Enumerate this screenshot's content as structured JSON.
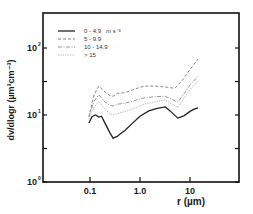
{
  "chart_data": {
    "type": "line",
    "title": "",
    "xlabel": "r (µm)",
    "ylabel": "dv/dlogr (µm³cm⁻³)",
    "xscale": "log",
    "yscale": "log",
    "xlim": [
      0.013,
      100
    ],
    "ylim": [
      1,
      300
    ],
    "x_ticks": [
      {
        "value": 0.1,
        "label": "0.1"
      },
      {
        "value": 1.0,
        "label": "1.0"
      },
      {
        "value": 10,
        "label": "10"
      }
    ],
    "y_ticks": [
      {
        "value": 1,
        "label": "10",
        "exp": "0"
      },
      {
        "value": 10,
        "label": "10",
        "exp": "1"
      },
      {
        "value": 100,
        "label": "10",
        "exp": "2"
      }
    ],
    "grid": false,
    "legend_position": "upper-left",
    "legend_unit": "m s⁻¹",
    "series": [
      {
        "name": "0 - 4.9",
        "style": "solid",
        "x": [
          0.095,
          0.11,
          0.13,
          0.15,
          0.17,
          0.2,
          0.25,
          0.29,
          0.35,
          0.4,
          0.5,
          0.7,
          1.0,
          1.5,
          2.2,
          3.2,
          4.0,
          5.7,
          7.5,
          10,
          12,
          14.5
        ],
        "y": [
          7.6,
          9.5,
          10,
          9.3,
          9.6,
          7.5,
          5.4,
          4.5,
          4.8,
          5.2,
          5.9,
          7.5,
          9.6,
          11.5,
          12.6,
          13.2,
          11.5,
          9.0,
          9.7,
          11.3,
          12.2,
          12.8
        ]
      },
      {
        "name": "5 - 9.9",
        "style": "dashed",
        "x": [
          0.095,
          0.12,
          0.15,
          0.2,
          0.25,
          0.29,
          0.35,
          0.5,
          0.8,
          1.2,
          2.0,
          3.5,
          5.0,
          7.0,
          10,
          14.5
        ],
        "y": [
          9.3,
          20,
          27,
          22,
          19.5,
          19,
          21,
          21.5,
          24.5,
          27,
          27,
          26,
          25,
          33,
          48,
          68
        ]
      },
      {
        "name": "10 - 14.9",
        "style": "dash-dot",
        "x": [
          0.095,
          0.12,
          0.15,
          0.2,
          0.25,
          0.29,
          0.35,
          0.5,
          0.8,
          1.2,
          2.0,
          3.2,
          5.7,
          8.0,
          10,
          14.5
        ],
        "y": [
          9.5,
          16,
          20,
          15.5,
          14,
          13.6,
          14.5,
          15,
          16.5,
          18,
          18.8,
          19,
          15.6,
          22,
          28,
          38
        ]
      },
      {
        "name": "> 15",
        "style": "dotted",
        "x": [
          0.095,
          0.12,
          0.15,
          0.2,
          0.25,
          0.29,
          0.35,
          0.5,
          0.8,
          1.2,
          2.0,
          3.2,
          5.7,
          8.0,
          10,
          14.5
        ],
        "y": [
          8.7,
          13,
          16,
          12,
          10.5,
          10,
          10.5,
          11.2,
          12.8,
          14.5,
          15.8,
          16.7,
          13,
          19,
          24,
          32
        ]
      }
    ]
  }
}
